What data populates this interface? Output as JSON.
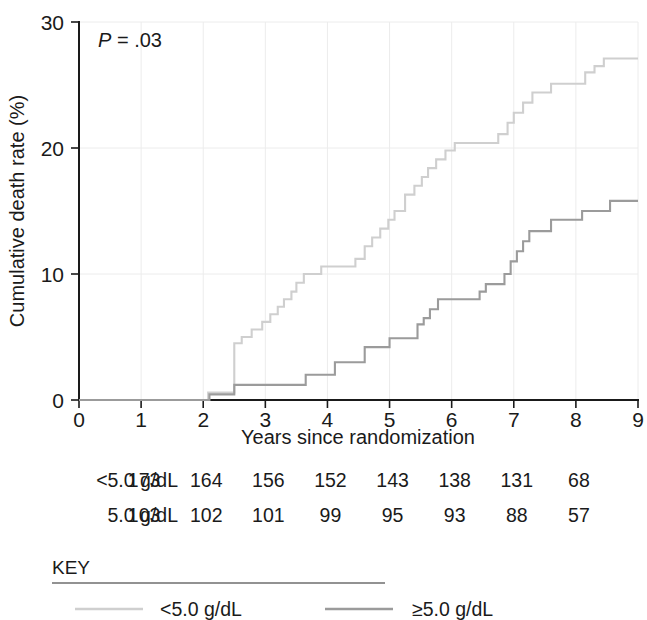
{
  "chart_data": {
    "type": "line",
    "subtype": "kaplan-meier-cumulative-incidence",
    "title": "",
    "xlabel": "Years since randomization",
    "ylabel": "Cumulative death rate (%)",
    "xlim": [
      0,
      9
    ],
    "ylim": [
      0,
      30
    ],
    "xticks": [
      0,
      1,
      2,
      3,
      4,
      5,
      6,
      7,
      8,
      9
    ],
    "yticks": [
      0,
      10,
      20,
      30
    ],
    "xtick_labels": [
      "0",
      "1",
      "2",
      "3",
      "4",
      "5",
      "6",
      "7",
      "8",
      "9"
    ],
    "ytick_labels": [
      "0",
      "10",
      "20",
      "30"
    ],
    "grid": "light horizontal gridlines at 10 and 20; light vertical gridlines at each integer year",
    "legend_position": "below-plot-key-box",
    "annotations": [
      {
        "name": "p-value",
        "text_italic": "P",
        "text_rest": " = .03",
        "x": 0.35,
        "y": 27.6
      }
    ],
    "series": [
      {
        "name": "<5.0 g/dL",
        "color": "#cfcfcf",
        "final_value": 27.1,
        "points": [
          [
            0,
            0
          ],
          [
            2.08,
            0
          ],
          [
            2.08,
            0.6
          ],
          [
            2.5,
            0.6
          ],
          [
            2.5,
            4.5
          ],
          [
            2.62,
            4.5
          ],
          [
            2.62,
            5.0
          ],
          [
            2.78,
            5.0
          ],
          [
            2.78,
            5.6
          ],
          [
            2.95,
            5.6
          ],
          [
            2.95,
            6.2
          ],
          [
            3.08,
            6.2
          ],
          [
            3.08,
            6.8
          ],
          [
            3.2,
            6.8
          ],
          [
            3.2,
            7.4
          ],
          [
            3.3,
            7.4
          ],
          [
            3.3,
            8.0
          ],
          [
            3.42,
            8.0
          ],
          [
            3.42,
            8.6
          ],
          [
            3.5,
            8.6
          ],
          [
            3.5,
            9.3
          ],
          [
            3.62,
            9.3
          ],
          [
            3.62,
            10.0
          ],
          [
            3.9,
            10.0
          ],
          [
            3.9,
            10.6
          ],
          [
            4.45,
            10.6
          ],
          [
            4.45,
            11.2
          ],
          [
            4.6,
            11.2
          ],
          [
            4.6,
            12.2
          ],
          [
            4.72,
            12.2
          ],
          [
            4.72,
            12.9
          ],
          [
            4.85,
            12.9
          ],
          [
            4.85,
            13.6
          ],
          [
            4.98,
            13.6
          ],
          [
            4.98,
            14.3
          ],
          [
            5.08,
            14.3
          ],
          [
            5.08,
            15.0
          ],
          [
            5.25,
            15.0
          ],
          [
            5.25,
            16.3
          ],
          [
            5.4,
            16.3
          ],
          [
            5.4,
            17.0
          ],
          [
            5.52,
            17.0
          ],
          [
            5.52,
            17.7
          ],
          [
            5.62,
            17.7
          ],
          [
            5.62,
            18.4
          ],
          [
            5.75,
            18.4
          ],
          [
            5.75,
            19.1
          ],
          [
            5.9,
            19.1
          ],
          [
            5.9,
            19.8
          ],
          [
            6.05,
            19.8
          ],
          [
            6.05,
            20.4
          ],
          [
            6.75,
            20.4
          ],
          [
            6.75,
            21.1
          ],
          [
            6.9,
            21.1
          ],
          [
            6.9,
            22.0
          ],
          [
            7.0,
            22.0
          ],
          [
            7.0,
            22.8
          ],
          [
            7.15,
            22.8
          ],
          [
            7.15,
            23.6
          ],
          [
            7.3,
            23.6
          ],
          [
            7.3,
            24.4
          ],
          [
            7.6,
            24.4
          ],
          [
            7.6,
            25.1
          ],
          [
            8.15,
            25.1
          ],
          [
            8.15,
            26.0
          ],
          [
            8.3,
            26.0
          ],
          [
            8.3,
            26.5
          ],
          [
            8.45,
            26.5
          ],
          [
            8.45,
            27.1
          ],
          [
            9,
            27.1
          ]
        ]
      },
      {
        "name": "≥5.0 g/dL",
        "color": "#9b9b9b",
        "final_value": 15.8,
        "points": [
          [
            0,
            0
          ],
          [
            2.1,
            0
          ],
          [
            2.1,
            0.45
          ],
          [
            2.5,
            0.45
          ],
          [
            2.5,
            1.2
          ],
          [
            3.65,
            1.2
          ],
          [
            3.65,
            2.0
          ],
          [
            4.12,
            2.0
          ],
          [
            4.12,
            3.0
          ],
          [
            4.6,
            3.0
          ],
          [
            4.6,
            4.2
          ],
          [
            5.0,
            4.2
          ],
          [
            5.0,
            4.9
          ],
          [
            5.45,
            4.9
          ],
          [
            5.45,
            6.0
          ],
          [
            5.55,
            6.0
          ],
          [
            5.55,
            6.5
          ],
          [
            5.65,
            6.5
          ],
          [
            5.65,
            7.2
          ],
          [
            5.78,
            7.2
          ],
          [
            5.78,
            8.0
          ],
          [
            6.45,
            8.0
          ],
          [
            6.45,
            8.6
          ],
          [
            6.55,
            8.6
          ],
          [
            6.55,
            9.2
          ],
          [
            6.85,
            9.2
          ],
          [
            6.85,
            10.0
          ],
          [
            6.95,
            10.0
          ],
          [
            6.95,
            11.0
          ],
          [
            7.05,
            11.0
          ],
          [
            7.05,
            11.8
          ],
          [
            7.15,
            11.8
          ],
          [
            7.15,
            12.6
          ],
          [
            7.25,
            12.6
          ],
          [
            7.25,
            13.4
          ],
          [
            7.6,
            13.4
          ],
          [
            7.6,
            14.3
          ],
          [
            8.1,
            14.3
          ],
          [
            8.1,
            15.0
          ],
          [
            8.55,
            15.0
          ],
          [
            8.55,
            15.8
          ],
          [
            9,
            15.8
          ]
        ]
      }
    ]
  },
  "pvalue": {
    "italic": "P",
    "rest": " = .03"
  },
  "axes": {
    "xlabel": "Years since randomization",
    "ylabel": "Cumulative death rate (%)",
    "xtick_labels": [
      "0",
      "1",
      "2",
      "3",
      "4",
      "5",
      "6",
      "7",
      "8",
      "9"
    ],
    "ytick_labels": [
      "0",
      "10",
      "20",
      "30"
    ]
  },
  "risk_table": {
    "rows": [
      {
        "label": "<5.0 g/dL",
        "values": [
          "173",
          "164",
          "156",
          "152",
          "143",
          "138",
          "131",
          "68"
        ]
      },
      {
        "label": "5.0 g/dL",
        "values": [
          "103",
          "102",
          "101",
          "99",
          "95",
          "93",
          "88",
          "57"
        ]
      }
    ]
  },
  "key": {
    "title": "KEY",
    "entries": [
      {
        "label": "<5.0 g/dL",
        "color": "#cfcfcf"
      },
      {
        "label": "≥5.0 g/dL",
        "color": "#9b9b9b"
      }
    ]
  }
}
